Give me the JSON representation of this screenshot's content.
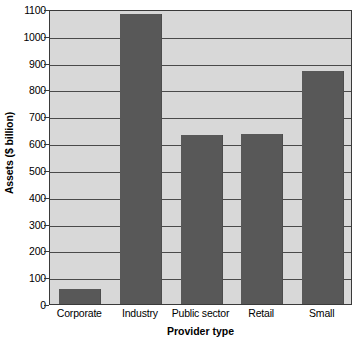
{
  "chart_data": {
    "type": "bar",
    "title": "",
    "subtitle": "",
    "xlabel": "Provider type",
    "ylabel": "Assets ($ billion)",
    "categories": [
      "Corporate",
      "Industry",
      "Public sector",
      "Retail",
      "Small"
    ],
    "values": [
      57,
      1080,
      630,
      635,
      868
    ],
    "series": [
      {
        "name": "Assets",
        "values": [
          57,
          1080,
          630,
          635,
          868
        ]
      }
    ],
    "ylim": [
      0,
      1100
    ],
    "ytick_labels": [
      "0",
      "100",
      "200",
      "300",
      "400",
      "500",
      "600",
      "700",
      "800",
      "900",
      "1000",
      "1100"
    ],
    "ytick_values": [
      0,
      100,
      200,
      300,
      400,
      500,
      600,
      700,
      800,
      900,
      1000,
      1100
    ],
    "ytick_step": 100,
    "grid": true,
    "grid_axis": "y",
    "legend": false,
    "legend_position": "none",
    "annotations": [],
    "colors": {
      "bar": "#585858",
      "plot_background": "#d8d8d8",
      "figure_background": "#ffffff",
      "axis": "#3a3a3a",
      "gridline": "#4a4a4a",
      "text": "#000000"
    }
  }
}
